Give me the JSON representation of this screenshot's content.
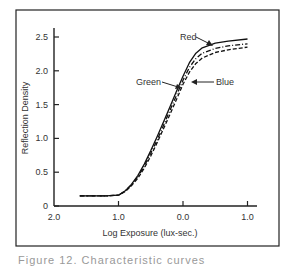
{
  "chart_data": {
    "type": "line",
    "title": "",
    "xlabel": "Log Exposure (lux-sec.)",
    "ylabel": "Reflection Density",
    "x_tick_labels": [
      "2.0",
      "1.0",
      "0.0",
      "1.0"
    ],
    "x_tick_values": [
      -2.0,
      -1.0,
      0.0,
      1.0
    ],
    "y_tick_labels": [
      "0",
      "0.5",
      "1.0",
      "1.5",
      "2.0",
      "2.5"
    ],
    "y_tick_values": [
      0,
      0.5,
      1.0,
      1.5,
      2.0,
      2.5
    ],
    "xlim": [
      -2.0,
      1.1
    ],
    "ylim": [
      0,
      2.6
    ],
    "grid": false,
    "legend": "inline arrow labels",
    "x": [
      -1.6,
      -1.2,
      -1.0,
      -0.9,
      -0.8,
      -0.7,
      -0.6,
      -0.5,
      -0.4,
      -0.3,
      -0.2,
      -0.1,
      0.0,
      0.1,
      0.2,
      0.3,
      0.5,
      0.7,
      1.0
    ],
    "series": [
      {
        "name": "Red",
        "style": "solid",
        "values": [
          0.15,
          0.15,
          0.16,
          0.22,
          0.32,
          0.45,
          0.62,
          0.82,
          1.03,
          1.25,
          1.47,
          1.7,
          1.92,
          2.12,
          2.26,
          2.34,
          2.41,
          2.44,
          2.47
        ]
      },
      {
        "name": "Green",
        "style": "dash-dot",
        "values": [
          0.15,
          0.15,
          0.16,
          0.22,
          0.31,
          0.43,
          0.59,
          0.78,
          0.98,
          1.2,
          1.42,
          1.64,
          1.86,
          2.05,
          2.18,
          2.26,
          2.33,
          2.37,
          2.4
        ]
      },
      {
        "name": "Blue",
        "style": "dashed",
        "values": [
          0.15,
          0.15,
          0.16,
          0.21,
          0.3,
          0.41,
          0.56,
          0.74,
          0.94,
          1.15,
          1.36,
          1.58,
          1.8,
          1.98,
          2.11,
          2.19,
          2.27,
          2.31,
          2.35
        ]
      }
    ],
    "annotations": [
      "Red",
      "Green",
      "Blue"
    ]
  },
  "labels": {
    "x_title": "Log Exposure (lux-sec.)",
    "y_title": "Reflection Density",
    "red": "Red",
    "green": "Green",
    "blue": "Blue"
  },
  "caption": "Figure 12. Characteristic curves"
}
